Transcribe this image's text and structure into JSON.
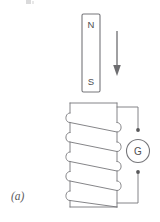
{
  "figure": {
    "panel_label": "(a)",
    "caption_fragment_visible": true
  },
  "magnet": {
    "name": "bar-magnet",
    "north_label": "N",
    "south_label": "S",
    "x": 82,
    "y": 14,
    "width": 18,
    "height": 78,
    "fill": "#ffffff",
    "stroke": "#76767a"
  },
  "motion_arrow": {
    "name": "downward-motion-arrow",
    "direction": "down",
    "x": 117,
    "y_start": 31,
    "y_end": 75,
    "color": "#6d6d70"
  },
  "coil": {
    "name": "solenoid-coil",
    "turns": 5,
    "left": 66,
    "right": 117,
    "top": 103,
    "bottom": 207,
    "stroke": "#77777a"
  },
  "galvanometer": {
    "name": "galvanometer",
    "label": "G",
    "cx": 138,
    "cy": 151,
    "r": 11.5,
    "terminal_top_y": 130,
    "terminal_bottom_y": 172,
    "stroke": "#76767a",
    "dot_color": "#58585a"
  },
  "colors": {
    "background": "#ffffff",
    "line": "#77777a",
    "text": "#58585a"
  }
}
